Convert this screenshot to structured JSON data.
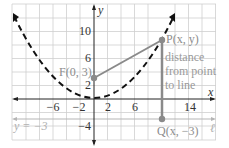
{
  "figure": {
    "x_axis_label": "x",
    "y_axis_label": "y",
    "x_ticks": [
      {
        "value": -6,
        "label": "−6"
      },
      {
        "value": -2,
        "label": "−2"
      },
      {
        "value": 2,
        "label": "2"
      },
      {
        "value": 6,
        "label": "6"
      },
      {
        "value": 14,
        "label": "14"
      }
    ],
    "y_ticks": [
      {
        "value": 10,
        "label": "10"
      },
      {
        "value": 6,
        "label": "6"
      },
      {
        "value": 2,
        "label": "2"
      },
      {
        "value": -4,
        "label": "−4"
      }
    ],
    "focus_label": "F(0, 3)",
    "point_p_label": "P(x, y)",
    "point_q_label": "Q(x, −3)",
    "distance_label_lines": [
      "distance",
      "from point",
      "to line"
    ],
    "directrix_label": "y = −3",
    "line_label": "ℓ",
    "colors": {
      "grid": "#c9c9c9",
      "axis": "#222222",
      "parabola": "#111111",
      "segment": "#888888",
      "point": "#8a8a8a",
      "directrix": "#b5b5b5",
      "label_gray": "#8c8c8c",
      "label_dark": "#333333"
    }
  }
}
